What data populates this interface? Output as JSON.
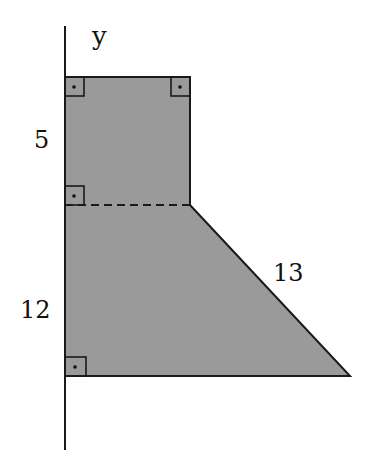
{
  "diagram": {
    "type": "geometry-figure",
    "axis": {
      "label": "y"
    },
    "labels": {
      "upper_side": "5",
      "lower_side": "12",
      "slanted_side": "13"
    },
    "right_angle_markers": 4,
    "colors": {
      "fill": "#9a9a9a",
      "stroke": "#1a1a1a",
      "background": "#ffffff"
    }
  }
}
